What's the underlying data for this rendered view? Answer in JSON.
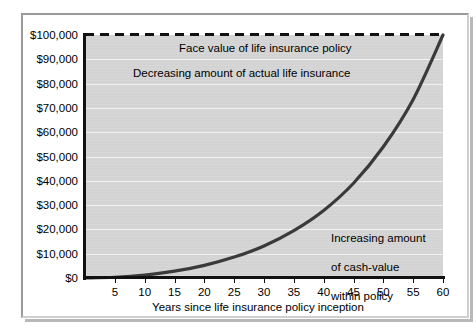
{
  "chart_data": {
    "type": "line",
    "title": "",
    "subtitle": "",
    "xlabel": "Years since life insurance policy inception",
    "ylabel": "",
    "xlim": [
      0,
      60
    ],
    "ylim": [
      0,
      100000
    ],
    "grid": true,
    "legend_position": "none",
    "x_ticks": [
      5,
      10,
      15,
      20,
      25,
      30,
      35,
      40,
      45,
      50,
      55,
      60
    ],
    "x_tick_labels": [
      "5",
      "10",
      "15",
      "20",
      "25",
      "30",
      "35",
      "40",
      "45",
      "50",
      "55",
      "60"
    ],
    "y_ticks": [
      0,
      10000,
      20000,
      30000,
      40000,
      50000,
      60000,
      70000,
      80000,
      90000,
      100000
    ],
    "y_tick_labels": [
      "$0",
      "$10,000",
      "$20,000",
      "$30,000",
      "$40,000",
      "$50,000",
      "$60,000",
      "$70,000",
      "$80,000",
      "$90,000",
      "$100,000"
    ],
    "series": [
      {
        "name": "Face value of life insurance policy",
        "style": "dashed",
        "color": "#111111",
        "x": [
          0,
          60
        ],
        "values": [
          100000,
          100000
        ]
      },
      {
        "name": "Cash value within policy",
        "style": "solid",
        "color": "#3a3a3a",
        "x": [
          0,
          5,
          10,
          15,
          20,
          25,
          30,
          35,
          40,
          45,
          50,
          55,
          60
        ],
        "values": [
          0,
          300,
          1200,
          2800,
          5200,
          8600,
          13200,
          19500,
          27800,
          39000,
          54000,
          73500,
          100000
        ]
      }
    ],
    "annotations": [
      {
        "name": "face-value-label",
        "text": "Face value of life insurance policy",
        "x": 20,
        "y": 97000
      },
      {
        "name": "decreasing-insurance-label",
        "text": "Decreasing amount of actual life insurance",
        "x": 12,
        "y": 86500
      },
      {
        "name": "increasing-cash-value-label",
        "text": "Increasing amount\nof cash-value\nwithin policy",
        "x": 46,
        "y": 25000
      }
    ],
    "colors": {
      "plot_background": "#d3d3d3",
      "gridline": "#f2f2f2",
      "axis": "#111111",
      "curve": "#3a3a3a",
      "page_background": "#ffffff",
      "frame_border": "#9a9a9a"
    }
  },
  "axis": {
    "x_title": "Years since life insurance policy inception"
  },
  "annotations": {
    "face_value": "Face value of life insurance policy",
    "decreasing": "Decreasing amount of actual life insurance",
    "increasing_line1": "Increasing amount",
    "increasing_line2": "of cash-value",
    "increasing_line3": "within policy"
  }
}
